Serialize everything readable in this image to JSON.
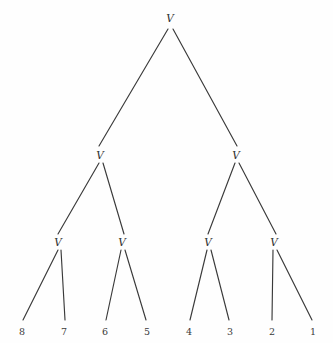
{
  "figure": {
    "type": "binary-tree-diagram",
    "width": 333,
    "height": 343,
    "background_color": "#fefefe",
    "edge_color": "#3a3a3a",
    "text_color": "#2f2f2f"
  },
  "tree": {
    "depth": 4,
    "internal_node_label": "V",
    "nodes": [
      {
        "id": "root",
        "label": "V",
        "level": 0,
        "x": 170,
        "y": 18,
        "kind": "internal"
      },
      {
        "id": "n-l",
        "label": "V",
        "level": 1,
        "x": 100,
        "y": 155,
        "kind": "internal"
      },
      {
        "id": "n-r",
        "label": "V",
        "level": 1,
        "x": 236,
        "y": 155,
        "kind": "internal"
      },
      {
        "id": "n-ll",
        "label": "V",
        "level": 2,
        "x": 58,
        "y": 242,
        "kind": "internal"
      },
      {
        "id": "n-lr",
        "label": "V",
        "level": 2,
        "x": 122,
        "y": 242,
        "kind": "internal"
      },
      {
        "id": "n-rl",
        "label": "V",
        "level": 2,
        "x": 208,
        "y": 242,
        "kind": "internal"
      },
      {
        "id": "n-rr",
        "label": "V",
        "level": 2,
        "x": 274,
        "y": 242,
        "kind": "internal"
      }
    ],
    "leaves": [
      {
        "id": "leaf-8",
        "label": "8",
        "x": 22,
        "y": 332,
        "parent": "n-ll",
        "tip_x": 23,
        "tip_y": 320
      },
      {
        "id": "leaf-7",
        "label": "7",
        "x": 64,
        "y": 332,
        "parent": "n-ll",
        "tip_x": 65,
        "tip_y": 320
      },
      {
        "id": "leaf-6",
        "label": "6",
        "x": 105,
        "y": 332,
        "parent": "n-lr",
        "tip_x": 106,
        "tip_y": 320
      },
      {
        "id": "leaf-5",
        "label": "5",
        "x": 147,
        "y": 332,
        "parent": "n-lr",
        "tip_x": 146,
        "tip_y": 320
      },
      {
        "id": "leaf-4",
        "label": "4",
        "x": 189,
        "y": 332,
        "parent": "n-rl",
        "tip_x": 190,
        "tip_y": 320
      },
      {
        "id": "leaf-3",
        "label": "3",
        "x": 230,
        "y": 332,
        "parent": "n-rl",
        "tip_x": 229,
        "tip_y": 320
      },
      {
        "id": "leaf-2",
        "label": "2",
        "x": 272,
        "y": 332,
        "parent": "n-rr",
        "tip_x": 272,
        "tip_y": 320
      },
      {
        "id": "leaf-1",
        "label": "1",
        "x": 313,
        "y": 332,
        "parent": "n-rr",
        "tip_x": 312,
        "tip_y": 320
      }
    ],
    "edges": [
      {
        "id": "e-root-l",
        "from": "root",
        "to": "n-l",
        "x1": 168,
        "y1": 29,
        "x2": 99,
        "y2": 146
      },
      {
        "id": "e-root-r",
        "from": "root",
        "to": "n-r",
        "x1": 173,
        "y1": 29,
        "x2": 237,
        "y2": 146
      },
      {
        "id": "e-l-ll",
        "from": "n-l",
        "to": "n-ll",
        "x1": 99,
        "y1": 163,
        "x2": 58,
        "y2": 234
      },
      {
        "id": "e-l-lr",
        "from": "n-l",
        "to": "n-lr",
        "x1": 103,
        "y1": 163,
        "x2": 124,
        "y2": 234
      },
      {
        "id": "e-r-rl",
        "from": "n-r",
        "to": "n-rl",
        "x1": 235,
        "y1": 163,
        "x2": 208,
        "y2": 234
      },
      {
        "id": "e-r-rr",
        "from": "n-r",
        "to": "n-rr",
        "x1": 239,
        "y1": 163,
        "x2": 276,
        "y2": 234
      },
      {
        "id": "e-ll-8",
        "from": "n-ll",
        "to": "leaf-8",
        "x1": 58,
        "y1": 250,
        "x2": 23,
        "y2": 320
      },
      {
        "id": "e-ll-7",
        "from": "n-ll",
        "to": "leaf-7",
        "x1": 61,
        "y1": 250,
        "x2": 65,
        "y2": 320
      },
      {
        "id": "e-lr-6",
        "from": "n-lr",
        "to": "leaf-6",
        "x1": 121,
        "y1": 250,
        "x2": 106,
        "y2": 320
      },
      {
        "id": "e-lr-5",
        "from": "n-lr",
        "to": "leaf-5",
        "x1": 125,
        "y1": 250,
        "x2": 146,
        "y2": 320
      },
      {
        "id": "e-rl-4",
        "from": "n-rl",
        "to": "leaf-4",
        "x1": 207,
        "y1": 250,
        "x2": 190,
        "y2": 320
      },
      {
        "id": "e-rl-3",
        "from": "n-rl",
        "to": "leaf-3",
        "x1": 211,
        "y1": 250,
        "x2": 229,
        "y2": 320
      },
      {
        "id": "e-rr-2",
        "from": "n-rr",
        "to": "leaf-2",
        "x1": 273,
        "y1": 250,
        "x2": 272,
        "y2": 320
      },
      {
        "id": "e-rr-1",
        "from": "n-rr",
        "to": "leaf-1",
        "x1": 277,
        "y1": 250,
        "x2": 312,
        "y2": 320
      }
    ]
  }
}
